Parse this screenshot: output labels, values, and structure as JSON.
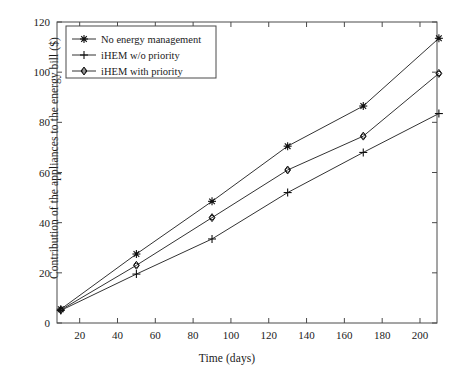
{
  "chart_data": {
    "type": "line",
    "title": "",
    "xlabel": "Time (days)",
    "ylabel": "Contribution of the appliances to the energy bill ($)",
    "xlim": [
      8,
      209
    ],
    "ylim": [
      0,
      120
    ],
    "xticks": [
      20,
      40,
      60,
      80,
      100,
      120,
      140,
      160,
      180,
      200
    ],
    "yticks": [
      0,
      20,
      40,
      60,
      80,
      100,
      120
    ],
    "grid": false,
    "legend_position": "upper-left",
    "x": [
      10,
      50,
      90,
      130,
      170,
      210
    ],
    "series": [
      {
        "name": "No energy management",
        "marker": "star",
        "values": [
          5.5,
          27.5,
          48.5,
          70.5,
          86.5,
          113.5
        ]
      },
      {
        "name": "iHEM w/o priority",
        "marker": "plus",
        "values": [
          5.0,
          19.5,
          33.5,
          52.0,
          68.0,
          83.5
        ]
      },
      {
        "name": "iHEM with priority",
        "marker": "diamond",
        "values": [
          5.2,
          23.0,
          42.0,
          61.0,
          74.5,
          99.5
        ]
      }
    ]
  },
  "axes": {
    "line_color": "#4a4a4a",
    "text_color": "#1a1a1a"
  },
  "legend": {
    "items": [
      "No energy management",
      "iHEM w/o priority",
      "iHEM with priority"
    ]
  }
}
